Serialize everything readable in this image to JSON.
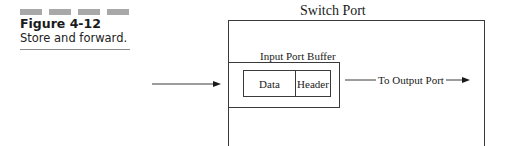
{
  "figure": {
    "number": "Figure 4-12",
    "caption": "Store and forward.",
    "decor_bar_color": "#a8a8a8"
  },
  "diagram": {
    "title": "Switch Port",
    "buffer_label": "Input Port Buffer",
    "packet": {
      "cells": [
        {
          "label": "Data"
        },
        {
          "label": "Header"
        }
      ]
    },
    "output_label": "To Output Port",
    "line_color": "#3a3a3a"
  }
}
